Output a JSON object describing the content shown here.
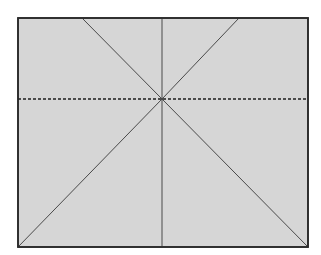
{
  "diagram": {
    "type": "crease-pattern",
    "canvas": {
      "width": 321,
      "height": 255
    },
    "colors": {
      "background": "#ffffff",
      "paper_fill": "#d6d6d6",
      "border": "#2a2a2a",
      "line": "#4a4a4a",
      "dashed_line": "#1e1e1e"
    },
    "rectangle": {
      "x": 18,
      "y": 18,
      "width": 290,
      "height": 229
    },
    "center": {
      "x": 162,
      "y": 99
    },
    "lines": [
      {
        "id": "diag-top-left",
        "x1": 82,
        "y1": 18,
        "x2": 162,
        "y2": 99,
        "style": "solid"
      },
      {
        "id": "diag-top-right",
        "x1": 239,
        "y1": 18,
        "x2": 162,
        "y2": 99,
        "style": "solid"
      },
      {
        "id": "diag-bottom-left",
        "x1": 162,
        "y1": 99,
        "x2": 18,
        "y2": 247,
        "style": "solid"
      },
      {
        "id": "diag-bottom-right",
        "x1": 162,
        "y1": 99,
        "x2": 308,
        "y2": 247,
        "style": "solid"
      },
      {
        "id": "vertical-center",
        "x1": 162,
        "y1": 18,
        "x2": 162,
        "y2": 247,
        "style": "solid"
      },
      {
        "id": "horizontal-fold",
        "x1": 18,
        "y1": 99,
        "x2": 308,
        "y2": 99,
        "style": "dashed"
      }
    ]
  }
}
